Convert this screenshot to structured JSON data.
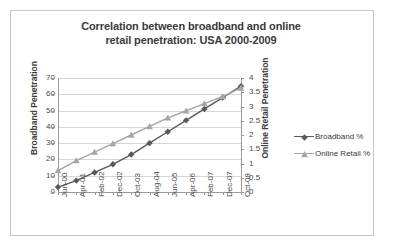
{
  "chart_data": {
    "type": "line",
    "title": "Correlation between broadband and online retail penetration: USA 2000-2009",
    "title_line1": "Correlation between broadband and online",
    "title_line2": "retail penetration: USA 2000-2009",
    "xlabel": "",
    "ylabel": "Broadband Penetration",
    "y2label": "Online Retail Penetration",
    "grid": true,
    "legend_position": "right",
    "ylim": [
      0,
      70
    ],
    "y2lim": [
      0,
      4
    ],
    "yticks": [
      "0",
      "10",
      "20",
      "30",
      "40",
      "50",
      "60",
      "70"
    ],
    "y2ticks": [
      "0",
      "0.5",
      "1",
      "1.5",
      "2",
      "2.5",
      "3",
      "3.5",
      "4"
    ],
    "categories": [
      "Jun-00",
      "Apr-01",
      "Feb-02",
      "Dec-02",
      "Oct-03",
      "Aug-04",
      "Jun-05",
      "Apr-06",
      "Feb-07",
      "Dec-07",
      "Oct-08"
    ],
    "series": [
      {
        "name": "Broadband %",
        "axis": "left",
        "color": "#595959",
        "marker": "diamond",
        "values": [
          3,
          7,
          12,
          17,
          23,
          30,
          37,
          44,
          51,
          58,
          65
        ]
      },
      {
        "name": "Online Retail %",
        "axis": "right",
        "color": "#a6a6a6",
        "marker": "triangle",
        "values": [
          0.75,
          1.1,
          1.4,
          1.7,
          2.0,
          2.3,
          2.6,
          2.85,
          3.1,
          3.35,
          3.65
        ]
      }
    ]
  },
  "legend": {
    "items": [
      {
        "label": "Broadband %",
        "color": "#595959",
        "marker": "diamond"
      },
      {
        "label": "Online Retail %",
        "color": "#a6a6a6",
        "marker": "triangle"
      }
    ]
  }
}
